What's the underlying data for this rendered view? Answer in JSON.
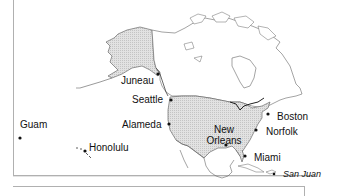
{
  "map": {
    "title": "",
    "region": "North America and Pacific",
    "highlight_color": "#d8d8d8",
    "outline_color": "#555555",
    "cities": [
      {
        "name": "Juneau",
        "style": "regular"
      },
      {
        "name": "Seattle",
        "style": "regular"
      },
      {
        "name": "Alameda",
        "style": "regular"
      },
      {
        "name": "Guam",
        "style": "regular"
      },
      {
        "name": "Honolulu",
        "style": "regular"
      },
      {
        "name": "New Orleans",
        "line1": "New",
        "line2": "Orleans",
        "style": "regular"
      },
      {
        "name": "Boston",
        "style": "regular"
      },
      {
        "name": "Norfolk",
        "style": "regular"
      },
      {
        "name": "Miami",
        "style": "regular"
      },
      {
        "name": "San Juan",
        "style": "italic"
      }
    ]
  }
}
